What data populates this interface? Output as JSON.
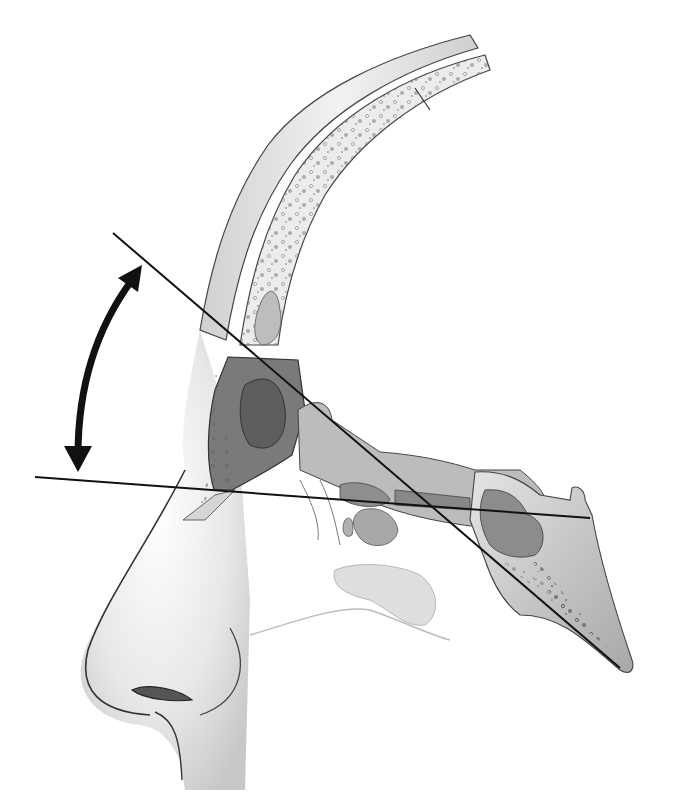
{
  "figure": {
    "type": "anatomical-illustration",
    "view": "sagittal-section",
    "style": "grayscale pencil illustration",
    "text_labels": []
  },
  "colors": {
    "background": "#ffffff",
    "line": "#111111",
    "bone_light": "#e6e6e6",
    "bone_mid": "#b8b8b8",
    "bone_dark": "#8a8a8a",
    "sinus": "#9a9a9a",
    "skin": "#ececec",
    "outline": "#3a3a3a"
  },
  "elements": {
    "reference_lines": [
      {
        "name": "oblique-line",
        "x1": 113,
        "y1": 233,
        "x2": 620,
        "y2": 668
      },
      {
        "name": "horizontal-line",
        "x1": 35,
        "y1": 477,
        "x2": 590,
        "y2": 518
      }
    ],
    "angle_arrow": {
      "name": "double-headed-curved-arrow",
      "from": [
        140,
        268
      ],
      "to": [
        75,
        470
      ]
    }
  }
}
